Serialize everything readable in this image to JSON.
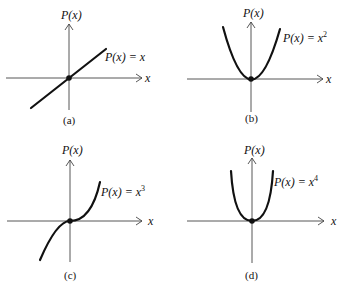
{
  "panels": [
    {
      "id": "a",
      "caption": "(a)",
      "y_label": "P(x)",
      "x_label": "x",
      "func_label": "P(x) = x",
      "exponent": ""
    },
    {
      "id": "b",
      "caption": "(b)",
      "y_label": "P(x)",
      "x_label": "x",
      "func_label": "P(x) = x",
      "exponent": "2"
    },
    {
      "id": "c",
      "caption": "(c)",
      "y_label": "P(x)",
      "x_label": "x",
      "func_label": "P(x) = x",
      "exponent": "3"
    },
    {
      "id": "d",
      "caption": "(d)",
      "y_label": "P(x)",
      "x_label": "x",
      "func_label": "P(x) = x",
      "exponent": "4"
    }
  ]
}
